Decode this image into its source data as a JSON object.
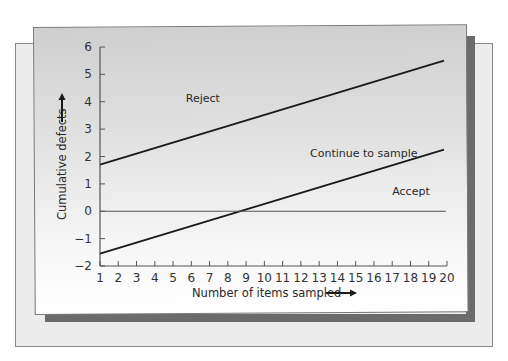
{
  "chart_data": {
    "type": "line",
    "title": "",
    "xlabel": "Number of items sampled",
    "ylabel": "Cumulative defects",
    "x_ticks": [
      1,
      2,
      3,
      4,
      5,
      6,
      7,
      8,
      9,
      10,
      11,
      12,
      13,
      14,
      15,
      16,
      17,
      18,
      19,
      20
    ],
    "y_ticks": [
      -2,
      -1,
      0,
      1,
      2,
      3,
      4,
      5,
      6
    ],
    "xlim": [
      1,
      20
    ],
    "ylim": [
      -2,
      6
    ],
    "grid": false,
    "series": [
      {
        "name": "Reject line",
        "x": [
          1,
          20
        ],
        "y": [
          1.7,
          5.5
        ]
      },
      {
        "name": "Accept line",
        "x": [
          1,
          20
        ],
        "y": [
          -1.55,
          2.25
        ]
      },
      {
        "name": "Zero line",
        "x": [
          1,
          20
        ],
        "y": [
          0,
          0
        ]
      }
    ],
    "annotations": [
      {
        "text": "Reject",
        "x": 5.7,
        "y": 4.0
      },
      {
        "text": "Continue to sample",
        "x": 12.5,
        "y": 2.0
      },
      {
        "text": "Accept",
        "x": 17.0,
        "y": 0.6
      }
    ]
  },
  "labels": {
    "xlabel": "Number of items sampled",
    "ylabel": "Cumulative defects",
    "reject": "Reject",
    "continue": "Continue to sample",
    "accept": "Accept"
  },
  "colors": {
    "line": "#1a1a1a",
    "zero_line": "#555555",
    "axis": "#555555",
    "shadow": "#6b6b6b"
  }
}
